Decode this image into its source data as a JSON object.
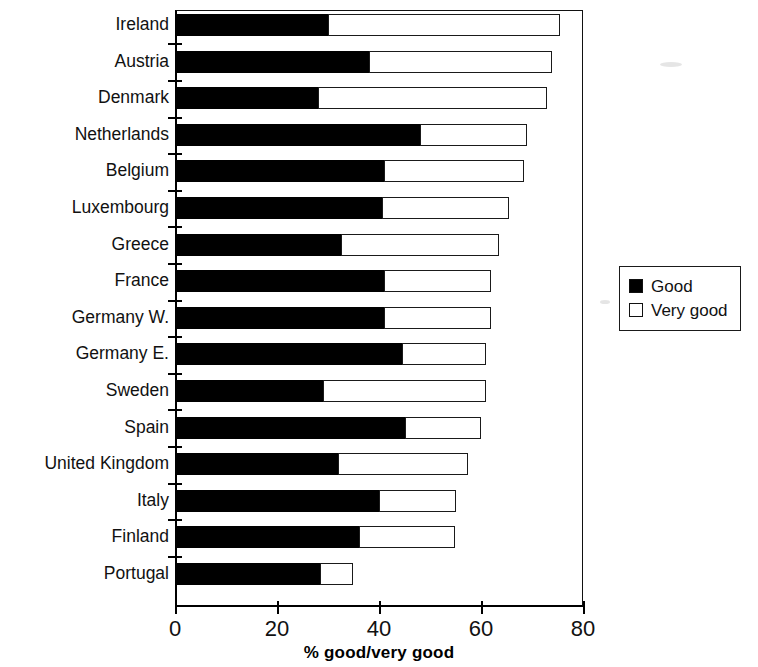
{
  "chart_data": {
    "type": "bar",
    "orientation": "horizontal",
    "stacked": true,
    "title": "",
    "xlabel": "% good/very good",
    "ylabel": "",
    "xlim": [
      0,
      80
    ],
    "xticks": [
      0,
      20,
      40,
      60,
      80
    ],
    "xtick_labels": [
      "0",
      "20",
      "40",
      "60",
      "80"
    ],
    "grid": false,
    "legend_position": "right",
    "categories": [
      "Ireland",
      "Austria",
      "Denmark",
      "Netherlands",
      "Belgium",
      "Luxembourg",
      "Greece",
      "France",
      "Germany W.",
      "Germany E.",
      "Sweden",
      "Spain",
      "United Kingdom",
      "Italy",
      "Finland",
      "Portugal"
    ],
    "series": [
      {
        "name": "Good",
        "color": "#000000",
        "values": [
          30,
          38,
          28,
          48,
          41,
          40.5,
          32.5,
          41,
          41,
          44.5,
          29,
          45,
          32,
          40,
          36,
          28.5
        ]
      },
      {
        "name": "Very good",
        "color": "#ffffff",
        "values": [
          45.5,
          36,
          45,
          21,
          27.5,
          25,
          31,
          21,
          21,
          16.5,
          32,
          15,
          25.5,
          15,
          19,
          6.5
        ]
      }
    ],
    "totals": [
      75.5,
      74,
      73,
      69,
      68.5,
      65.5,
      63.5,
      62,
      62,
      61,
      61,
      60,
      57.5,
      55,
      55,
      35
    ]
  },
  "legend": {
    "items": [
      {
        "label": "Good",
        "swatch": "filled-square"
      },
      {
        "label": "Very good",
        "swatch": "empty-square"
      }
    ]
  }
}
